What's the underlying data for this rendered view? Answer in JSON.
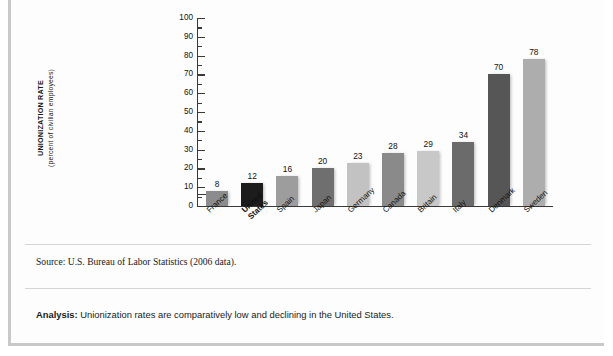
{
  "figure": {
    "source_note": "Source: U.S. Bureau of Labor Statistics (2006 data).",
    "analysis_label": "Analysis:",
    "analysis_text": "Unionization rates are comparatively low and declining in the United States."
  },
  "chart_data": {
    "type": "bar",
    "title": "",
    "xlabel": "",
    "ylabel": "UNIONIZATION RATE",
    "ylabel_sub": "(percent of civilian employees)",
    "ylim": [
      0,
      100
    ],
    "yticks": [
      100,
      90,
      80,
      70,
      60,
      50,
      40,
      30,
      20,
      10,
      0
    ],
    "grid": false,
    "legend": "none",
    "categories": [
      "France",
      "United States",
      "Spain",
      "Japan",
      "Germany",
      "Canada",
      "Britain",
      "Italy",
      "Denmark",
      "Sweden"
    ],
    "values": [
      8,
      12,
      16,
      20,
      23,
      28,
      29,
      34,
      70,
      78
    ],
    "colors": [
      "#8c8c8c",
      "#1c1c1c",
      "#9d9d9d",
      "#6f6f6f",
      "#c2c2c2",
      "#8a8a8a",
      "#c8c8c8",
      "#6b6b6b",
      "#565656",
      "#adadad"
    ],
    "highlight_category": "United States"
  }
}
